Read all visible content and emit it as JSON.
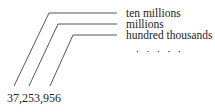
{
  "diagram": {
    "labels": [
      "ten millions",
      "millions",
      "hundred thousands"
    ],
    "ellipsis": ". . . . .",
    "number": "37,253,956"
  }
}
